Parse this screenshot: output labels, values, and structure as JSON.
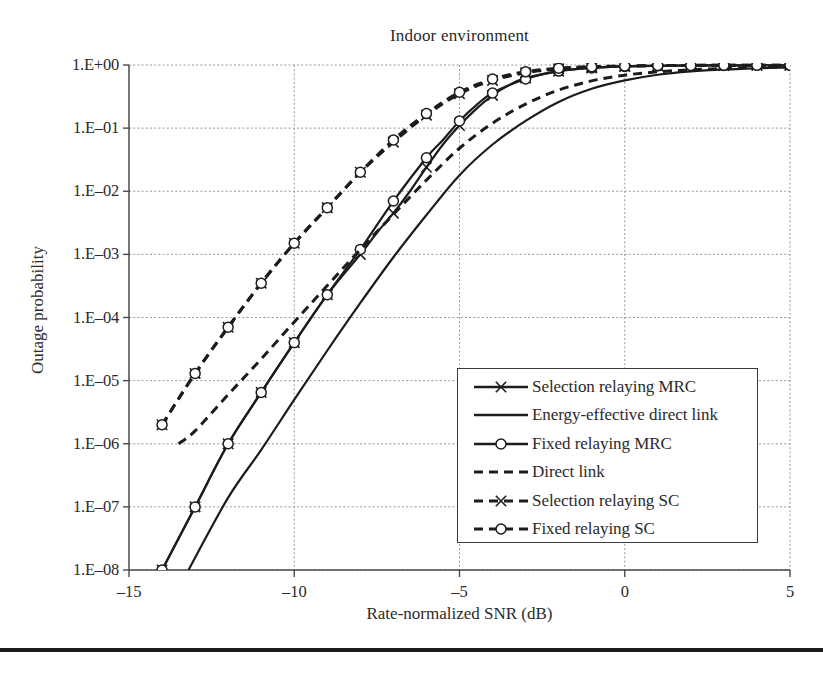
{
  "chart_data": {
    "type": "line",
    "title": "Indoor environment",
    "xlabel": "Rate-normalized SNR (dB)",
    "ylabel": "Outage probability",
    "xlim": [
      -15,
      5
    ],
    "ylim": [
      1e-08,
      1
    ],
    "yscale": "log",
    "grid": true,
    "legend_position": "center-right-inside",
    "xticks": [
      -15,
      -10,
      -5,
      0,
      5
    ],
    "xtick_labels": [
      "–15",
      "–10",
      "–5",
      "0",
      "5"
    ],
    "yticks": [
      1,
      0.1,
      0.01,
      0.001,
      0.0001,
      1e-05,
      1e-06,
      1e-07,
      1e-08
    ],
    "ytick_labels": [
      "1.E+00",
      "1.E–01",
      "1.E–02",
      "1.E–03",
      "1.E–04",
      "1.E–05",
      "1.E–06",
      "1.E–07",
      "1.E–08"
    ],
    "series": [
      {
        "name": "Selection relaying MRC",
        "style": "solid",
        "marker": "x",
        "x": [
          -14,
          -13,
          -12,
          -11,
          -10,
          -9,
          -8,
          -7.5,
          -7,
          -6.5,
          -6,
          -5.5,
          -5,
          -4.5,
          -4,
          -3.5,
          -3,
          -2,
          -1,
          0,
          1,
          2,
          3,
          4,
          5
        ],
        "y": [
          1e-08,
          1e-07,
          1e-06,
          6.5e-06,
          4e-05,
          0.00023,
          0.001,
          0.0022,
          0.0045,
          0.01,
          0.024,
          0.055,
          0.11,
          0.2,
          0.33,
          0.48,
          0.62,
          0.8,
          0.9,
          0.95,
          0.97,
          0.98,
          0.985,
          0.99,
          0.99
        ]
      },
      {
        "name": "Energy-effective direct link",
        "style": "solid",
        "marker": "none",
        "x": [
          -13.2,
          -12,
          -11,
          -10,
          -9,
          -8,
          -7,
          -6,
          -5,
          -4,
          -3,
          -2,
          -1,
          0,
          1,
          2,
          3,
          4,
          5
        ],
        "y": [
          1e-08,
          1.4e-07,
          8e-07,
          5e-06,
          3e-05,
          0.00017,
          0.0009,
          0.0042,
          0.018,
          0.055,
          0.13,
          0.26,
          0.42,
          0.57,
          0.7,
          0.79,
          0.85,
          0.89,
          0.92
        ]
      },
      {
        "name": "Fixed relaying MRC",
        "style": "solid",
        "marker": "circle",
        "x": [
          -14,
          -13,
          -12,
          -11,
          -10,
          -9,
          -8,
          -7,
          -6,
          -5.5,
          -5,
          -4.5,
          -4,
          -3,
          -2,
          -1,
          0,
          1,
          2,
          3,
          4,
          5
        ],
        "y": [
          1e-08,
          1e-07,
          1e-06,
          6.5e-06,
          4e-05,
          0.00023,
          0.0012,
          0.007,
          0.034,
          0.065,
          0.13,
          0.23,
          0.36,
          0.6,
          0.8,
          0.9,
          0.95,
          0.97,
          0.98,
          0.985,
          0.99,
          0.99
        ]
      },
      {
        "name": "Direct link",
        "style": "dashed",
        "marker": "none",
        "x": [
          -13.5,
          -13,
          -12,
          -11,
          -10,
          -9,
          -8,
          -7,
          -6,
          -5,
          -4,
          -3,
          -2,
          -1,
          0,
          1,
          2,
          3,
          4,
          5
        ],
        "y": [
          1e-06,
          1.6e-06,
          6e-06,
          2.2e-05,
          8.5e-05,
          0.00032,
          0.0012,
          0.0043,
          0.015,
          0.048,
          0.12,
          0.24,
          0.4,
          0.56,
          0.69,
          0.78,
          0.84,
          0.88,
          0.91,
          0.93
        ]
      },
      {
        "name": "Selection relaying SC",
        "style": "dashed",
        "marker": "x",
        "x": [
          -14,
          -13,
          -12,
          -11,
          -10,
          -9,
          -8,
          -7,
          -6,
          -5,
          -4,
          -3,
          -2,
          -1,
          0,
          1,
          2,
          3,
          4,
          5
        ],
        "y": [
          2e-06,
          1.3e-05,
          7e-05,
          0.00035,
          0.0015,
          0.0055,
          0.02,
          0.06,
          0.16,
          0.35,
          0.57,
          0.75,
          0.87,
          0.93,
          0.96,
          0.975,
          0.985,
          0.99,
          0.99,
          0.99
        ]
      },
      {
        "name": "Fixed relaying SC",
        "style": "dashed",
        "marker": "circle",
        "x": [
          -14,
          -13,
          -12,
          -11,
          -10,
          -9,
          -8,
          -7,
          -6,
          -5,
          -4,
          -3,
          -2,
          -1,
          0,
          1,
          2,
          3,
          4,
          5
        ],
        "y": [
          2e-06,
          1.3e-05,
          7e-05,
          0.00035,
          0.0015,
          0.0055,
          0.02,
          0.065,
          0.17,
          0.37,
          0.6,
          0.78,
          0.89,
          0.94,
          0.965,
          0.98,
          0.985,
          0.99,
          0.99,
          0.99
        ]
      }
    ]
  },
  "legend": {
    "items": [
      {
        "label": "Selection relaying MRC",
        "style": "solid",
        "marker": "x"
      },
      {
        "label": "Energy-effective direct link",
        "style": "solid",
        "marker": "none"
      },
      {
        "label": "Fixed relaying MRC",
        "style": "solid",
        "marker": "circle"
      },
      {
        "label": "Direct link",
        "style": "dashed",
        "marker": "none"
      },
      {
        "label": "Selection relaying SC",
        "style": "dashed",
        "marker": "x"
      },
      {
        "label": "Fixed relaying SC",
        "style": "dashed",
        "marker": "circle"
      }
    ]
  },
  "colors": {
    "line": "#1c1c1c",
    "grid": "#8c8c8c",
    "axis": "#4a4a4a",
    "text": "#2a2a2a",
    "background": "#ffffff"
  }
}
